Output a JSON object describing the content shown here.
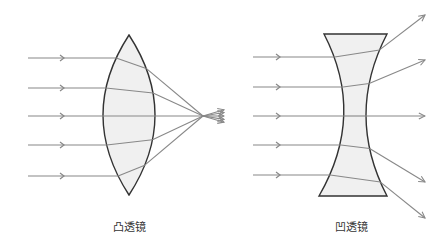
{
  "colors": {
    "ray": "#888888",
    "lens_outline": "#333333",
    "lens_fill": "#f0f0f0",
    "label_text": "#333333"
  },
  "convex_lens": {
    "label": "凸透镜",
    "top": [
      129,
      35
    ],
    "bottom": [
      129,
      195
    ],
    "left_bulge_x": 103,
    "right_bulge_x": 155,
    "ray_start_x": 28,
    "ray_ys": [
      58,
      88,
      116,
      145,
      176
    ],
    "focal_point": [
      203,
      116
    ],
    "ray_end_x": 224
  },
  "concave_lens": {
    "label": "凹透镜",
    "top_left": [
      324,
      34
    ],
    "top_right": [
      387,
      34
    ],
    "bottom_left": [
      319,
      196
    ],
    "bottom_right": [
      387,
      196
    ],
    "waist_left_x": 345,
    "waist_right_x": 366,
    "ray_start_x": 253,
    "ray_ys": [
      57,
      87,
      116,
      145,
      175
    ],
    "ray_ends": [
      [
        425,
        15
      ],
      [
        425,
        60
      ],
      [
        425,
        116
      ],
      [
        425,
        182
      ],
      [
        425,
        218
      ]
    ]
  }
}
